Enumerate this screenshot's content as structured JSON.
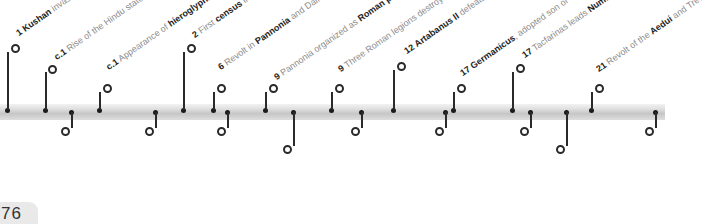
{
  "page_number": "76",
  "colors": {
    "band": "#cfcfcf",
    "text_muted": "#8a8a8a",
    "text_bold": "#1e1e1e",
    "marker": "#2a2a2a"
  },
  "events_above": [
    {
      "year": "1",
      "pre": "",
      "bold": "Kushan",
      "post": " invasion of northwest India"
    },
    {
      "year": "c.1",
      "pre": " Rise of the Hindu state of ",
      "bold": "Funan",
      "post": ""
    },
    {
      "year": "c.1",
      "pre": " Appearance of ",
      "bold": "hieroglyphic",
      "post": " writing in Mayan areas of Mexico"
    },
    {
      "year": "2",
      "pre": " First ",
      "bold": "census",
      "post": " in China"
    },
    {
      "year": "6",
      "pre": " Revolt in ",
      "bold": "Pannonia",
      "post": " and Dalmatia takes Tiberius three years to suppress"
    },
    {
      "year": "9",
      "pre": " Pannonia organized as ",
      "bold": "Roman province",
      "post": ""
    },
    {
      "year": "9",
      "pre": " Three Roman legions destroyed by Germanic tribes in ",
      "bold": "Teutoberg Forest",
      "post": ""
    },
    {
      "year": "12",
      "pre": " ",
      "bold": "Artabanus II",
      "post": " defeats the Scythian Pahlavas and becomes King of Parthia"
    },
    {
      "year": "17",
      "pre": " ",
      "bold": "Germanicus",
      "post": ", adopted son of Tiberius, defeats Germans"
    },
    {
      "year": "17",
      "pre": " Tacfarinas leads ",
      "bold": "Numidian revolt",
      "post": " against Roman rule in North Africa"
    },
    {
      "year": "21",
      "pre": " Revolt of the ",
      "bold": "Aedui",
      "post": " and Treveri in Gaul quickly put down"
    }
  ],
  "events_below": [
    {
      "year": "c.1",
      "pre": " ",
      "bold": "Buddhism spreads",
      "post": " to coastal areas of southeast Asian mainland"
    },
    {
      "year": "c.1",
      "pre": " ",
      "bold": "Moche culture",
      "post": " flourishes in northern Peru"
    },
    {
      "year": "6",
      "pre": " Roman procurator appointed to govern ",
      "bold": "Judaea",
      "post": ""
    },
    {
      "year": "9",
      "pre": " King Nakatamani of ",
      "bold": "Meroe",
      "post": " (in present-day Sudan) starts large-scale building programme"
    },
    {
      "year": "9",
      "pre": " Wang Mang seizes Chinese throne and establishes ",
      "bold": "Xin dynasty",
      "post": ""
    },
    {
      "year": "14",
      "pre": " Death of Augustus; he is succeeded by his adopted son ",
      "bold": "Tiberius",
      "post": ""
    },
    {
      "year": "17",
      "pre": " ",
      "bold": "Cappadocia",
      "post": " annexed to Rome"
    },
    {
      "year": "17",
      "pre": " Roman poet ",
      "bold": "Ovid",
      "post": " dies in exile (b.43 BCE)"
    },
    {
      "year": "23",
      "pre": " Collapse of China's Xin dynasty; ",
      "bold": "Han dynasty",
      "post": " restored, with its capital at Louyang"
    }
  ]
}
